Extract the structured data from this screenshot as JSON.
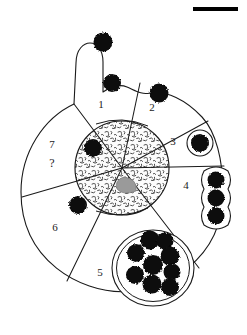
{
  "figure": {
    "background_color": "#ffffff",
    "line_color": "#1a1a1a",
    "particle_color": "#101010",
    "nucleolus_color": "#9a9a9a",
    "nucleus_fill": "#fbfbfb"
  },
  "scale_bar": {
    "name": "scale-bar",
    "color": "#000000",
    "x": 193,
    "y": 7,
    "width": 45,
    "height": 4
  },
  "cell": {
    "outline_name": "cell-membrane-outline",
    "center_x": 122,
    "center_y": 192,
    "radius_x": 101,
    "radius_y": 101,
    "pseudopod_name": "pseudopod-projection"
  },
  "nucleus": {
    "name": "nucleus",
    "center_x": 122,
    "center_y": 168,
    "radius": 47,
    "texture": "stippled-chromatin",
    "nucleolus_label": "nucleolus"
  },
  "sectors": [
    {
      "id": "1",
      "label": "1",
      "label_x": 101,
      "label_y": 105,
      "name": "sector-1"
    },
    {
      "id": "2",
      "label": "2",
      "label_x": 152,
      "label_y": 108,
      "name": "sector-2"
    },
    {
      "id": "3",
      "label": "3",
      "label_x": 173,
      "label_y": 142,
      "name": "sector-3"
    },
    {
      "id": "4",
      "label": "4",
      "label_x": 186,
      "label_y": 186,
      "name": "sector-4"
    },
    {
      "id": "5",
      "label": "5",
      "label_x": 100,
      "label_y": 273,
      "name": "sector-5"
    },
    {
      "id": "6",
      "label": "6",
      "label_x": 55,
      "label_y": 228,
      "name": "sector-6"
    },
    {
      "id": "7",
      "label": "7",
      "label_x": 52,
      "label_y": 145,
      "name": "sector-7"
    }
  ],
  "query_mark": {
    "label": "?",
    "x": 52,
    "y": 163,
    "name": "sector-7-question-mark"
  },
  "particles": {
    "external": [
      {
        "name": "external-particle-1",
        "cx": 103,
        "cy": 42,
        "r": 9.5
      },
      {
        "name": "external-particle-2",
        "cx": 112,
        "cy": 83,
        "r": 9.0
      },
      {
        "name": "external-particle-3",
        "cx": 159,
        "cy": 93,
        "r": 9.5
      }
    ],
    "sector3_engulfed": {
      "name": "engulfed-particle-sector-3",
      "cx": 200,
      "cy": 143,
      "r": 9.0,
      "vesicle": true
    },
    "sector4_chain": [
      {
        "name": "phagosome-particle-4a",
        "cx": 216,
        "cy": 180,
        "r": 8.5
      },
      {
        "name": "phagosome-particle-4b",
        "cx": 216,
        "cy": 198,
        "r": 8.5
      },
      {
        "name": "phagosome-particle-4c",
        "cx": 216,
        "cy": 216,
        "r": 8.5
      }
    ],
    "sector5_vacuole": {
      "name": "phagolysosome-vacuole",
      "cx": 153,
      "cy": 268,
      "rx": 39,
      "ry": 36,
      "contents": [
        {
          "name": "vacuole-particle-1",
          "cx": 150,
          "cy": 240,
          "r": 9.5
        },
        {
          "name": "vacuole-particle-2",
          "cx": 163,
          "cy": 240,
          "r": 8.5
        },
        {
          "name": "vacuole-particle-3",
          "cx": 139,
          "cy": 252,
          "r": 9.0
        },
        {
          "name": "vacuole-particle-4",
          "cx": 167,
          "cy": 254,
          "r": 9.5
        },
        {
          "name": "vacuole-particle-5",
          "cx": 154,
          "cy": 263,
          "r": 10.0
        },
        {
          "name": "vacuole-particle-6",
          "cx": 137,
          "cy": 272,
          "r": 9.0
        },
        {
          "name": "vacuole-particle-7",
          "cx": 170,
          "cy": 268,
          "r": 8.5
        },
        {
          "name": "vacuole-particle-8",
          "cx": 153,
          "cy": 281,
          "r": 9.5
        },
        {
          "name": "vacuole-particle-9",
          "cx": 170,
          "cy": 283,
          "r": 9.0
        }
      ]
    },
    "intracellular": [
      {
        "name": "cytoplasm-particle-sector-7",
        "cx": 93,
        "cy": 148,
        "r": 9.0
      },
      {
        "name": "cytoplasm-particle-sector-6",
        "cx": 78,
        "cy": 205,
        "r": 9.0
      }
    ]
  }
}
